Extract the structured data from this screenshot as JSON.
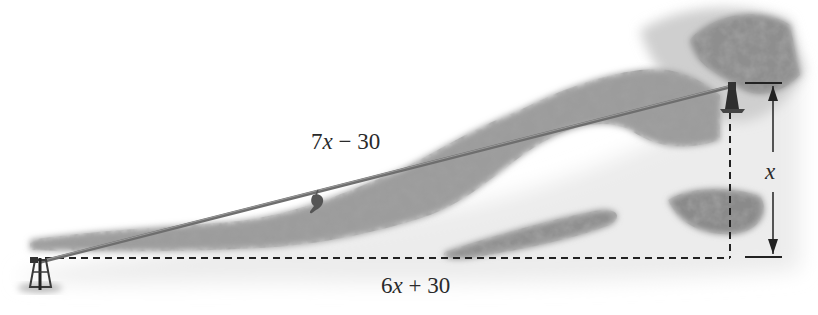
{
  "figure": {
    "type": "zipline-right-triangle-diagram",
    "top_cropped_text": "",
    "labels": {
      "hypotenuse": {
        "coef": "7",
        "var": "x",
        "op": " − ",
        "const": "30"
      },
      "base": {
        "coef": "6",
        "var": "x",
        "op": " + ",
        "const": "30"
      },
      "height": {
        "var": "x"
      }
    },
    "elements": {
      "zipline": {
        "from": [
          40,
          262
        ],
        "to": [
          733,
          86
        ],
        "color": "#6e6e6e"
      },
      "base_dashed_line": {
        "from": [
          45,
          258
        ],
        "to": [
          730,
          258
        ],
        "color": "#222222"
      },
      "height_dashed_line": {
        "from": [
          730,
          100
        ],
        "to": [
          730,
          258
        ],
        "color": "#222222"
      },
      "height_dimension_arrow": {
        "x": 773,
        "top": 83,
        "bottom": 257,
        "color": "#222222"
      }
    },
    "colors": {
      "background": "#ffffff",
      "foliage_dark": "#6a6a6a",
      "foliage_mid": "#9a9a9a",
      "foliage_light": "#c8c8c8",
      "ground_shade": "#e4e4e4",
      "text": "#2a2a2a"
    }
  }
}
